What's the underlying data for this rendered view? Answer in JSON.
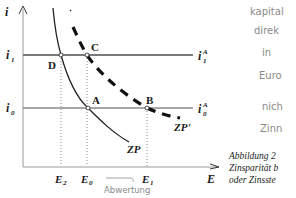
{
  "diagram": {
    "axes": {
      "y_label": "i",
      "x_label": "E"
    },
    "y_ticks": [
      {
        "id": "i1",
        "label": "i",
        "sub": "1"
      },
      {
        "id": "i0",
        "label": "i",
        "sub": "0"
      }
    ],
    "x_ticks": [
      {
        "id": "E2",
        "label": "E",
        "sub": "2"
      },
      {
        "id": "E0",
        "label": "E",
        "sub": "0"
      },
      {
        "id": "E1",
        "label": "E",
        "sub": "1"
      }
    ],
    "lines": [
      {
        "id": "i1A",
        "label": "i",
        "sup": "A",
        "sub": "1"
      },
      {
        "id": "i0A",
        "label": "i",
        "sup": "A",
        "sub": "0"
      }
    ],
    "curves": [
      {
        "id": "ZP",
        "label": "ZP",
        "style": "solid"
      },
      {
        "id": "ZPprime",
        "label": "ZP'",
        "style": "dashed"
      }
    ],
    "points": [
      "A",
      "B",
      "C",
      "D"
    ],
    "handwritten_annotation": "Abwertung",
    "colors": {
      "ink": "#1a1a1a",
      "rate_line": "#7a7a7a",
      "handwriting": "#8a8a8a"
    }
  },
  "margin_notes": [
    "kapital",
    "direk",
    "in",
    "Euro",
    "nich",
    "Zinn"
  ],
  "caption": {
    "lines": [
      "Abbildung 2",
      "Zinsparität b",
      "oder Zinsste"
    ]
  }
}
